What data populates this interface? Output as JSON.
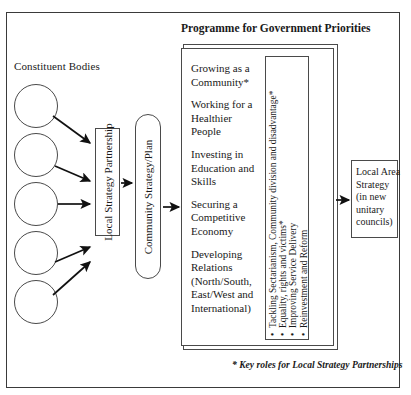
{
  "diagram": {
    "frame": {
      "border_color": "#3a3a3a"
    },
    "constituent": {
      "label": "Constituent Bodies",
      "circle_count": 5,
      "circles": [
        {
          "name": "constituent-body-1"
        },
        {
          "name": "constituent-body-2"
        },
        {
          "name": "constituent-body-3"
        },
        {
          "name": "constituent-body-4"
        },
        {
          "name": "constituent-body-5"
        }
      ]
    },
    "lsp": {
      "label": "Local Strategy Partnership"
    },
    "community_strategy": {
      "label": "Community Strategy/Plan"
    },
    "programme": {
      "title": "Programme for Government Priorities",
      "priorities": [
        "Growing as a Community*",
        "Working for a Healthier People",
        "Investing in Education and Skills",
        "Securing a Competitive Economy",
        "Developing Relations (North/South, East/West and International)"
      ],
      "key_roles": [
        "Tackling Sectarianism, Community division  and disadvantage*",
        "Equality, rights and victims*",
        "Improving Service Delivery",
        "Reinvestment and Reform"
      ],
      "bullet_glyph": "•"
    },
    "local_area_strategy": {
      "lines": [
        "Local Area",
        "Strategy",
        "(in new",
        "unitary",
        "councils)"
      ]
    },
    "footnote": "* Key roles for Local Strategy Partnerships"
  }
}
